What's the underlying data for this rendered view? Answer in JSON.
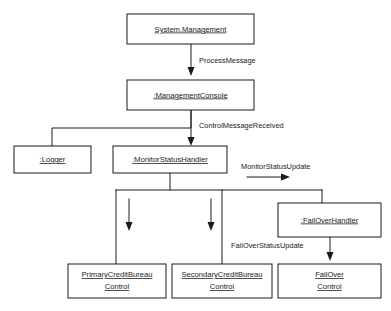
{
  "diagram": {
    "kind": "uml-collaboration-diagram",
    "background_color": "#ffffff",
    "line_color": "#1a1a1a",
    "box_fill": "#ffffff",
    "nodes": {
      "system_management": {
        "label": "System.Management"
      },
      "management_console": {
        "label": ":ManagementConsole"
      },
      "logger": {
        "label": ":Logger"
      },
      "monitor_status_handler": {
        "label": ":MonitorStatusHandler"
      },
      "fail_over_handler": {
        "label": ":FailOverHandler"
      },
      "primary_credit_bureau_control": {
        "label_line1": "PrimaryCreditBureau",
        "label_line2": "Control"
      },
      "secondary_credit_bureau_control": {
        "label_line1": "SecondaryCreditBureau",
        "label_line2": "Control"
      },
      "fail_over_control": {
        "label_line1": "FailOver",
        "label_line2": "Control"
      }
    },
    "edges": {
      "process_message": {
        "label": "ProcessMessage"
      },
      "control_message_received": {
        "label": "ControlMessageReceived"
      },
      "monitor_status_update": {
        "label": "MonitorStatusUpdate"
      },
      "fail_over_status_update": {
        "label": "FailOverStatusUpdate"
      }
    }
  }
}
